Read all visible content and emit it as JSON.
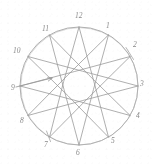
{
  "figure": {
    "stroke_color": "#9a9a9a",
    "label_color": "#8a8a8a",
    "background_color": "#ffffff",
    "circle": {
      "cx": 79,
      "cy": 86,
      "r": 59
    }
  },
  "chart_data": {
    "type": "diagram",
    "title": "",
    "xlabel": "",
    "ylabel": "",
    "point_count": 12,
    "points": [
      {
        "number": "1",
        "label": "1",
        "angle_deg": 60,
        "px": 108.5,
        "py": 34.9,
        "label_x": 106,
        "label_y": 22
      },
      {
        "number": "2",
        "label": "2",
        "angle_deg": 30,
        "px": 130.1,
        "py": 56.5,
        "label_x": 133,
        "label_y": 41
      },
      {
        "number": "3",
        "label": "3",
        "angle_deg": 0,
        "px": 138.0,
        "py": 86.0,
        "label_x": 140,
        "label_y": 80
      },
      {
        "number": "4",
        "label": "4",
        "angle_deg": -30,
        "px": 130.1,
        "py": 115.5,
        "label_x": 136,
        "label_y": 112
      },
      {
        "number": "5",
        "label": "5",
        "angle_deg": -60,
        "px": 108.5,
        "py": 137.1,
        "label_x": 111,
        "label_y": 137
      },
      {
        "number": "6",
        "label": "6",
        "angle_deg": -90,
        "px": 79.0,
        "py": 145.0,
        "label_x": 76,
        "label_y": 149
      },
      {
        "number": "7",
        "label": "7",
        "angle_deg": -120,
        "px": 49.5,
        "py": 137.1,
        "label_x": 44,
        "label_y": 141
      },
      {
        "number": "8",
        "label": "8",
        "angle_deg": -150,
        "px": 27.9,
        "py": 115.5,
        "label_x": 20,
        "label_y": 117
      },
      {
        "number": "9",
        "label": "9",
        "angle_deg": 180,
        "px": 20.0,
        "py": 86.0,
        "label_x": 11,
        "label_y": 84
      },
      {
        "number": "10",
        "label": "10",
        "angle_deg": 150,
        "px": 27.9,
        "py": 56.5,
        "label_x": 13,
        "label_y": 47
      },
      {
        "number": "11",
        "label": "11",
        "angle_deg": 120,
        "px": 49.5,
        "py": 34.9,
        "label_x": 42,
        "label_y": 25
      },
      {
        "number": "12",
        "label": "12",
        "angle_deg": 90,
        "px": 79.0,
        "py": 27.0,
        "label_x": 75,
        "label_y": 12
      }
    ],
    "chords": [
      {
        "from": "12",
        "to": "5"
      },
      {
        "from": "1",
        "to": "6"
      },
      {
        "from": "2",
        "to": "7"
      },
      {
        "from": "3",
        "to": "8"
      },
      {
        "from": "4",
        "to": "9"
      },
      {
        "from": "5",
        "to": "10"
      },
      {
        "from": "6",
        "to": "11"
      },
      {
        "from": "7",
        "to": "12"
      },
      {
        "from": "8",
        "to": "1"
      },
      {
        "from": "9",
        "to": "2"
      },
      {
        "from": "10",
        "to": "3"
      },
      {
        "from": "11",
        "to": "4"
      }
    ],
    "arrow": {
      "name": "direction-arrow",
      "from_x": 16,
      "from_y": 87,
      "to_x": 52,
      "to_y": 78,
      "description": "arrow from point 9 pointing inward/right"
    },
    "tick_marks": [
      {
        "at": "2",
        "description": "short tick crossing circle near point 2"
      },
      {
        "at": "7",
        "description": "short tick crossing circle near point 7"
      }
    ]
  }
}
